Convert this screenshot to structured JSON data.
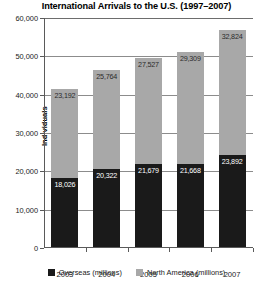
{
  "chart_data": {
    "type": "bar",
    "subtype": "stacked-bar",
    "title": "International Arrivals to the U.S. (1997–2007)",
    "xlabel": "",
    "ylabel": "Individuals",
    "categories": [
      "2003",
      "2004",
      "2005",
      "2006",
      "2007"
    ],
    "series": [
      {
        "name": "Overseas (millions)",
        "color": "#1a1a1a",
        "values": [
          18026,
          20322,
          21679,
          21668,
          23892
        ],
        "labels": [
          "18,026",
          "20,322",
          "21,679",
          "21,668",
          "23,892"
        ]
      },
      {
        "name": "North America (millions)",
        "color": "#a8a8a8",
        "values": [
          23192,
          25764,
          27527,
          29309,
          32824
        ],
        "labels": [
          "23,192",
          "25,764",
          "27,527",
          "29,309",
          "32,824"
        ]
      }
    ],
    "totals": [
      41218,
      46086,
      49206,
      50977,
      56716
    ],
    "ylim": [
      0,
      60000
    ],
    "yticks": [
      0,
      10000,
      20000,
      30000,
      40000,
      50000,
      60000
    ],
    "ytick_labels": [
      "0",
      "10,000",
      "20,000",
      "30,000",
      "40,000",
      "50,000",
      "60,000"
    ],
    "grid": true,
    "legend_position": "bottom"
  },
  "legend": {
    "items": [
      {
        "label": "Overseas (millions)",
        "color": "#1a1a1a"
      },
      {
        "label": "North America (millions)",
        "color": "#a8a8a8"
      }
    ]
  }
}
